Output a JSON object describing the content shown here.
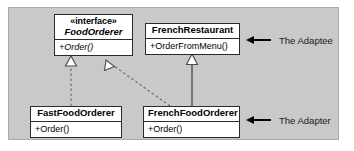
{
  "diagram": {
    "panel_color": "#c9c9c9",
    "box_fill": "#ffffff",
    "line_color": "#2b2b2b",
    "classes": [
      {
        "id": "foodorderer",
        "stereotype": "«interface»",
        "name": "FoodOrderer",
        "abstract": true,
        "operations": [
          "+Order()"
        ]
      },
      {
        "id": "frenchrestaurant",
        "stereotype": "",
        "name": "FrenchRestaurant",
        "abstract": false,
        "operations": [
          "+OrderFromMenu()"
        ]
      },
      {
        "id": "fastfoodorderer",
        "stereotype": "",
        "name": "FastFoodOrderer",
        "abstract": false,
        "operations": [
          "+Order()"
        ]
      },
      {
        "id": "frenchfoodorderer",
        "stereotype": "",
        "name": "FrenchFoodOrderer",
        "abstract": false,
        "operations": [
          "+Order()"
        ]
      }
    ],
    "relationships": [
      {
        "id": "fastfood-realizes-foodorderer",
        "type": "realization",
        "style": "dashed",
        "from": "FastFoodOrderer",
        "to": "FoodOrderer",
        "arrowhead": "hollow-triangle"
      },
      {
        "id": "frenchfood-realizes-foodorderer",
        "type": "realization",
        "style": "dashed",
        "from": "FrenchFoodOrderer",
        "to": "FoodOrderer",
        "arrowhead": "hollow-triangle"
      },
      {
        "id": "frenchfood-inherits-frenchrestaurant",
        "type": "generalization",
        "style": "solid",
        "from": "FrenchFoodOrderer",
        "to": "FrenchRestaurant",
        "arrowhead": "hollow-triangle"
      }
    ],
    "annotations": [
      {
        "id": "adaptee",
        "label": "The Adaptee",
        "points_at": "FrenchRestaurant"
      },
      {
        "id": "adapter",
        "label": "The Adapter",
        "points_at": "FrenchFoodOrderer"
      }
    ]
  }
}
